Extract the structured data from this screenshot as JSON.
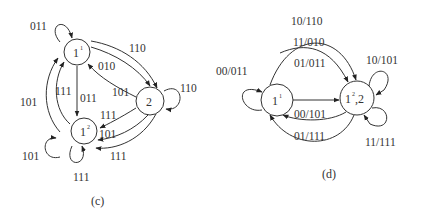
{
  "diagram_c": {
    "caption": "(c)",
    "nodes": [
      {
        "id": "1_1",
        "base": "1",
        "sup": "1"
      },
      {
        "id": "1_2",
        "base": "1",
        "sup": "2"
      },
      {
        "id": "2",
        "base": "2",
        "sup": ""
      }
    ],
    "edges": [
      {
        "from": "1_1",
        "to": "1_1",
        "label": "011"
      },
      {
        "from": "1_1",
        "to": "2",
        "label": "110"
      },
      {
        "from": "1_1",
        "to": "2",
        "label": "010"
      },
      {
        "from": "2",
        "to": "1_1",
        "label": "101"
      },
      {
        "from": "2",
        "to": "2",
        "label": "110"
      },
      {
        "from": "1_1",
        "to": "1_2",
        "label": "011"
      },
      {
        "from": "1_2",
        "to": "1_1",
        "label": "111"
      },
      {
        "from": "1_2",
        "to": "1_1",
        "label": "101"
      },
      {
        "from": "2",
        "to": "1_2",
        "label": "111"
      },
      {
        "from": "2",
        "to": "1_2",
        "label": "101"
      },
      {
        "from": "2",
        "to": "1_2",
        "label": "111"
      },
      {
        "from": "1_2",
        "to": "1_2",
        "label": "101"
      },
      {
        "from": "1_2",
        "to": "1_2",
        "label": "111"
      }
    ]
  },
  "diagram_d": {
    "caption": "(d)",
    "nodes": [
      {
        "id": "1_1",
        "base": "1",
        "sup": "1",
        "suffix": ""
      },
      {
        "id": "1_2_2",
        "base": "1",
        "sup": "2",
        "suffix": ",2"
      }
    ],
    "edges": [
      {
        "from": "1_1",
        "to": "1_1",
        "label": "00/011"
      },
      {
        "from": "1_1",
        "to": "1_2_2",
        "label": "10/110"
      },
      {
        "from": "1_1",
        "to": "1_2_2",
        "label": "11/010"
      },
      {
        "from": "1_1",
        "to": "1_2_2",
        "label": "01/011"
      },
      {
        "from": "1_2_2",
        "to": "1_1",
        "label": "00/101"
      },
      {
        "from": "1_2_2",
        "to": "1_1",
        "label": "01/111"
      },
      {
        "from": "1_2_2",
        "to": "1_2_2",
        "label": "10/101"
      },
      {
        "from": "1_2_2",
        "to": "1_2_2",
        "label": "11/111"
      }
    ]
  }
}
